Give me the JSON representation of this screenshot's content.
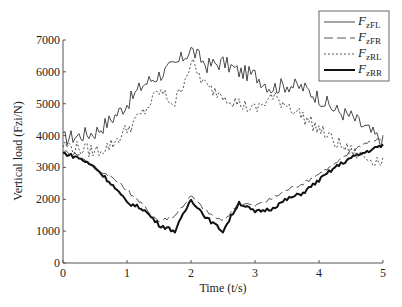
{
  "chart_data": {
    "type": "line",
    "title": "",
    "xlabel": "Time (t/s)",
    "ylabel": "Vertical load (Fzi/N)",
    "xlim": [
      0,
      5
    ],
    "ylim": [
      0,
      7000
    ],
    "xticks": [
      "0",
      "1",
      "2",
      "3",
      "4",
      "5"
    ],
    "yticks": [
      "0",
      "1000",
      "2000",
      "3000",
      "4000",
      "5000",
      "6000",
      "7000"
    ],
    "grid": false,
    "legend_position": "upper right",
    "x": [
      0,
      0.25,
      0.5,
      0.75,
      1,
      1.25,
      1.5,
      1.75,
      2,
      2.25,
      2.5,
      2.75,
      3,
      3.25,
      3.5,
      3.75,
      4,
      4.25,
      4.5,
      4.75,
      5
    ],
    "series": [
      {
        "name": "FzFL",
        "sub": "zFL",
        "style": "solid-thin",
        "values": [
          3900,
          4000,
          4100,
          4500,
          5000,
          5600,
          5900,
          6200,
          6700,
          6200,
          6300,
          6000,
          5900,
          5500,
          5600,
          5500,
          5200,
          4800,
          4600,
          4200,
          3800
        ]
      },
      {
        "name": "FzFR",
        "sub": "zFR",
        "style": "long-dash",
        "values": [
          3500,
          3400,
          3000,
          2700,
          2300,
          1800,
          1300,
          1500,
          2100,
          1600,
          1300,
          1900,
          1800,
          2000,
          2300,
          2500,
          2800,
          3100,
          3500,
          3800,
          3900
        ]
      },
      {
        "name": "FzRL",
        "sub": "zRL",
        "style": "dotted",
        "values": [
          3700,
          3600,
          3500,
          3700,
          4200,
          4700,
          5400,
          5000,
          6300,
          5500,
          5300,
          5000,
          4800,
          5200,
          5000,
          4600,
          4200,
          3800,
          3500,
          3300,
          3200
        ]
      },
      {
        "name": "FzRR",
        "sub": "zRR",
        "style": "solid-thick",
        "values": [
          3450,
          3300,
          3000,
          2500,
          1900,
          1700,
          1200,
          1000,
          2000,
          1400,
          1000,
          1900,
          1600,
          1700,
          2000,
          2200,
          2600,
          3000,
          3300,
          3500,
          3700
        ]
      }
    ]
  },
  "legend": {
    "items": [
      {
        "main": "F",
        "sub": "zFL"
      },
      {
        "main": "F",
        "sub": "zFR"
      },
      {
        "main": "F",
        "sub": "zRL"
      },
      {
        "main": "F",
        "sub": "zRR"
      }
    ]
  },
  "axes": {
    "xlabel": "Time (t/s)",
    "ylabel": "Vertical load (Fzi/N)",
    "xticks": [
      "0",
      "1",
      "2",
      "3",
      "4",
      "5"
    ],
    "yticks": [
      "0",
      "1000",
      "2000",
      "3000",
      "4000",
      "5000",
      "6000",
      "7000"
    ]
  }
}
